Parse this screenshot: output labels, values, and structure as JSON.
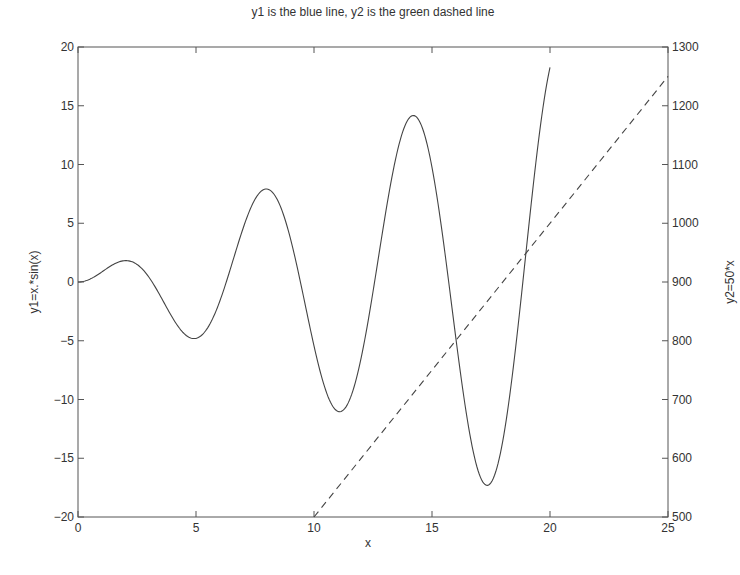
{
  "chart_data": {
    "type": "line",
    "title": "y1 is the blue line,  y2 is the green dashed line",
    "xlabel": "x",
    "ylabel": "y1=x.*sin(x)",
    "ylabel_right": "y2=50*x",
    "xlim": [
      0,
      25
    ],
    "ylim": [
      -20,
      20
    ],
    "ylim_right": [
      500,
      1300
    ],
    "x_ticks": [
      0,
      5,
      10,
      15,
      20,
      25
    ],
    "y_ticks": [
      -20,
      -15,
      -10,
      -5,
      0,
      5,
      10,
      15,
      20
    ],
    "y_ticks_right": [
      500,
      600,
      700,
      800,
      900,
      1000,
      1100,
      1200,
      1300
    ],
    "grid": false,
    "legend": null,
    "series": [
      {
        "name": "y1",
        "axis": "left",
        "style": "solid",
        "formula": "y1 = x.*sin(x)",
        "x_range": [
          0,
          20
        ],
        "key_points": [
          {
            "x": 0,
            "y": 0
          },
          {
            "x": 2.03,
            "y": 1.82
          },
          {
            "x": 4.91,
            "y": -4.81
          },
          {
            "x": 7.98,
            "y": 7.92
          },
          {
            "x": 11.09,
            "y": -11.04
          },
          {
            "x": 14.21,
            "y": 14.17
          },
          {
            "x": 17.34,
            "y": -17.31
          },
          {
            "x": 20,
            "y": 18.26
          }
        ]
      },
      {
        "name": "y2",
        "axis": "right",
        "style": "dashed",
        "formula": "y2 = 50*x",
        "x_range": [
          10,
          25
        ],
        "key_points": [
          {
            "x": 10,
            "y": 500
          },
          {
            "x": 15,
            "y": 750
          },
          {
            "x": 20,
            "y": 1000
          },
          {
            "x": 25,
            "y": 1250
          }
        ]
      }
    ]
  }
}
